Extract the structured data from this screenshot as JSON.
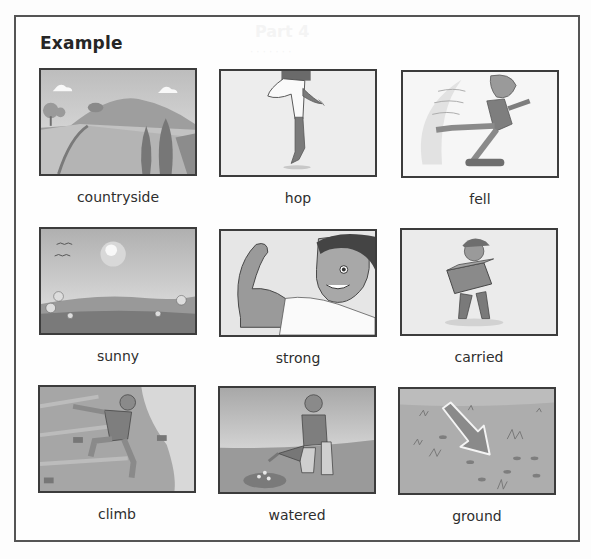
{
  "worksheet": {
    "title": "Example",
    "items": [
      {
        "word": "countryside",
        "picture": "countryside-picture"
      },
      {
        "word": "hop",
        "picture": "hop-picture"
      },
      {
        "word": "fell",
        "picture": "fell-picture"
      },
      {
        "word": "sunny",
        "picture": "sunny-picture"
      },
      {
        "word": "strong",
        "picture": "strong-picture"
      },
      {
        "word": "carried",
        "picture": "carried-picture"
      },
      {
        "word": "climb",
        "picture": "climb-picture"
      },
      {
        "word": "watered",
        "picture": "watered-picture"
      },
      {
        "word": "ground",
        "picture": "ground-picture"
      }
    ]
  },
  "colors": {
    "frame_border": "#555555",
    "panel_border": "#3c3c3c",
    "text": "#2e2e2e"
  }
}
